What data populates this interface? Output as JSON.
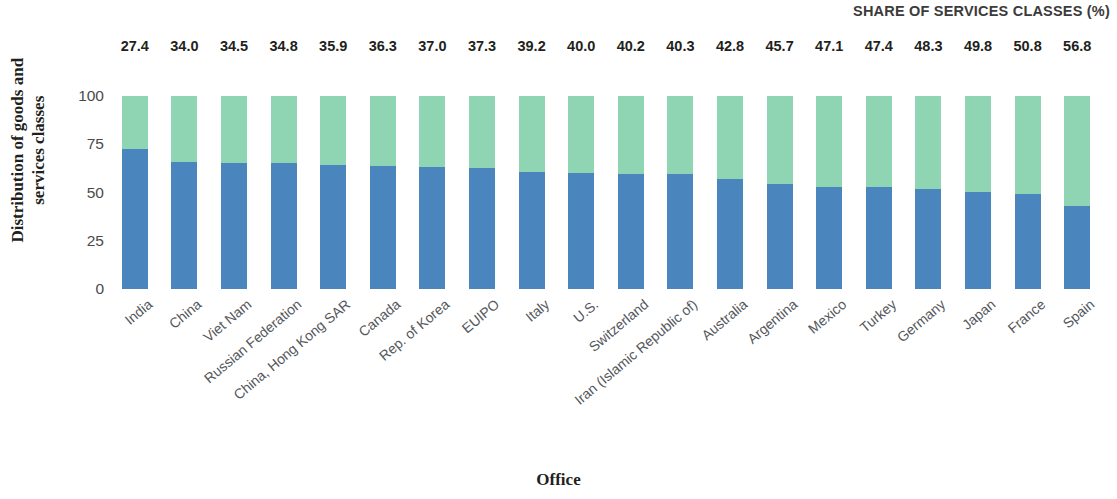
{
  "header": {
    "series_header": "SHARE OF SERVICES CLASSES (%)"
  },
  "axes": {
    "y_title_line1": "Distribution of goods and",
    "y_title_line2": "services classes",
    "x_title": "Office",
    "y_ticks": [
      "100",
      "75",
      "50",
      "25",
      "0"
    ]
  },
  "colors": {
    "services": "#8fd5b4",
    "goods": "#4a85bd",
    "value_label": "#231f20",
    "category_label": "#55585c",
    "header_text": "#3b3b3b",
    "background": "#ffffff"
  },
  "chart_data": {
    "type": "bar",
    "title": "",
    "subtitle": "",
    "xlabel": "Office",
    "ylabel": "Distribution of goods and services classes",
    "ylim": [
      0,
      100
    ],
    "yticks": [
      0,
      25,
      50,
      75,
      100
    ],
    "grid": false,
    "legend_position": "none",
    "stacked": true,
    "stack_total": 100,
    "annotation": "SHARE OF SERVICES CLASSES (%)",
    "categories": [
      "India",
      "China",
      "Viet Nam",
      "Russian Federation",
      "China, Hong Kong SAR",
      "Canada",
      "Rep. of Korea",
      "EUIPO",
      "Italy",
      "U.S.",
      "Switzerland",
      "Iran (Islamic Republic of)",
      "Australia",
      "Argentina",
      "Mexico",
      "Turkey",
      "Germany",
      "Japan",
      "France",
      "Spain"
    ],
    "series": [
      {
        "name": "Goods classes",
        "color": "#4a85bd",
        "values": [
          72.6,
          66.0,
          65.5,
          65.2,
          64.1,
          63.7,
          63.0,
          62.7,
          60.8,
          60.0,
          59.8,
          59.7,
          57.2,
          54.3,
          52.9,
          52.6,
          51.7,
          50.2,
          49.2,
          43.2
        ]
      },
      {
        "name": "Services classes",
        "color": "#8fd5b4",
        "values": [
          27.4,
          34.0,
          34.5,
          34.8,
          35.9,
          36.3,
          37.0,
          37.3,
          39.2,
          40.0,
          40.2,
          40.3,
          42.8,
          45.7,
          47.1,
          47.4,
          48.3,
          49.8,
          50.8,
          56.8
        ]
      }
    ],
    "data_labels": [
      "27.4",
      "34.0",
      "34.5",
      "34.8",
      "35.9",
      "36.3",
      "37.0",
      "37.3",
      "39.2",
      "40.0",
      "40.2",
      "40.3",
      "42.8",
      "45.7",
      "47.1",
      "47.4",
      "48.3",
      "49.8",
      "50.8",
      "56.8"
    ]
  }
}
